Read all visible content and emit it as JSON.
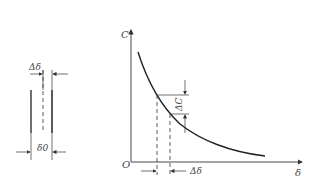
{
  "left_figure": {
    "top_label": "Δδ",
    "bottom_label": "δ0"
  },
  "right_figure": {
    "y_axis_label": "C",
    "x_axis_label": "δ",
    "origin_label": "O",
    "delta_c_label": "ΔC",
    "delta_delta_label": "Δδ"
  },
  "colors": {
    "line": "#333333",
    "text": "#444444",
    "background": "#ffffff"
  }
}
